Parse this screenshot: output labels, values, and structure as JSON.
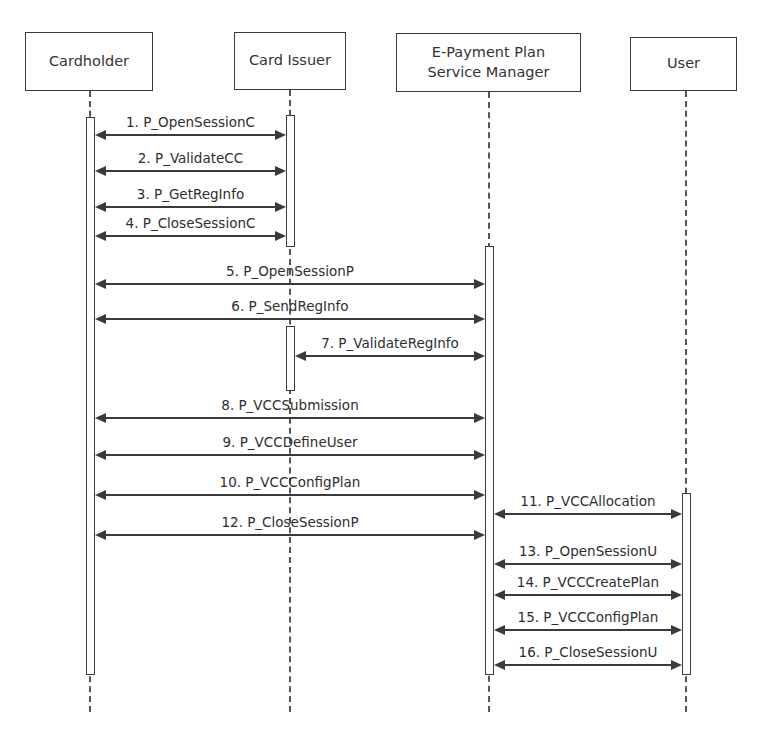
{
  "diagram": {
    "type": "sequence",
    "actors": [
      {
        "id": "cardholder",
        "label": "Cardholder",
        "x": 25,
        "y": 32,
        "w": 128,
        "h": 59,
        "cx": 90
      },
      {
        "id": "card_issuer",
        "label": "Card Issuer",
        "x": 234,
        "y": 32,
        "w": 112,
        "h": 58,
        "cx": 290
      },
      {
        "id": "epayment",
        "label": "E-Payment Plan\nService Manager",
        "x": 396,
        "y": 33,
        "w": 185,
        "h": 59,
        "cx": 489
      },
      {
        "id": "user",
        "label": "User",
        "x": 630,
        "y": 37,
        "w": 107,
        "h": 54,
        "cx": 686
      }
    ],
    "lifeline_end_y": 712,
    "activations": [
      {
        "actor": "cardholder",
        "x": 86,
        "y": 117,
        "w": 9,
        "h": 558
      },
      {
        "actor": "card_issuer",
        "x": 286,
        "y": 115,
        "w": 9,
        "h": 132
      },
      {
        "actor": "card_issuer",
        "x": 286,
        "y": 326,
        "w": 9,
        "h": 65
      },
      {
        "actor": "epayment",
        "x": 485,
        "y": 246,
        "w": 9,
        "h": 429
      },
      {
        "actor": "user",
        "x": 682,
        "y": 493,
        "w": 9,
        "h": 182
      }
    ],
    "messages": [
      {
        "n": 1,
        "label": "1. P_OpenSessionC",
        "x1": 95,
        "x2": 286,
        "y": 135
      },
      {
        "n": 2,
        "label": "2. P_ValidateCC",
        "x1": 95,
        "x2": 286,
        "y": 171
      },
      {
        "n": 3,
        "label": "3. P_GetRegInfo",
        "x1": 95,
        "x2": 286,
        "y": 207
      },
      {
        "n": 4,
        "label": "4. P_CloseSessionC",
        "x1": 95,
        "x2": 286,
        "y": 236
      },
      {
        "n": 5,
        "label": "5. P_OpenSessionP",
        "x1": 95,
        "x2": 485,
        "y": 284
      },
      {
        "n": 6,
        "label": "6. P_SendRegInfo",
        "x1": 95,
        "x2": 485,
        "y": 319
      },
      {
        "n": 7,
        "label": "7. P_ValidateRegInfo",
        "x1": 295,
        "x2": 485,
        "y": 356
      },
      {
        "n": 8,
        "label": "8. P_VCCSubmission",
        "x1": 95,
        "x2": 485,
        "y": 418
      },
      {
        "n": 9,
        "label": "9. P_VCCDefineUser",
        "x1": 95,
        "x2": 485,
        "y": 455
      },
      {
        "n": 10,
        "label": "10. P_VCCConfigPlan",
        "x1": 95,
        "x2": 485,
        "y": 495
      },
      {
        "n": 11,
        "label": "11. P_VCCAllocation",
        "x1": 494,
        "x2": 682,
        "y": 514
      },
      {
        "n": 12,
        "label": "12. P_CloseSessionP",
        "x1": 95,
        "x2": 485,
        "y": 535
      },
      {
        "n": 13,
        "label": "13. P_OpenSessionU",
        "x1": 494,
        "x2": 682,
        "y": 564
      },
      {
        "n": 14,
        "label": "14. P_VCCCreatePlan",
        "x1": 494,
        "x2": 682,
        "y": 595
      },
      {
        "n": 15,
        "label": "15. P_VCCConfigPlan",
        "x1": 494,
        "x2": 682,
        "y": 630
      },
      {
        "n": 16,
        "label": "16. P_CloseSessionU",
        "x1": 494,
        "x2": 682,
        "y": 665
      }
    ],
    "colors": {
      "line": "#3a3a3a",
      "text": "#2e2e2e",
      "background": "#ffffff"
    }
  }
}
